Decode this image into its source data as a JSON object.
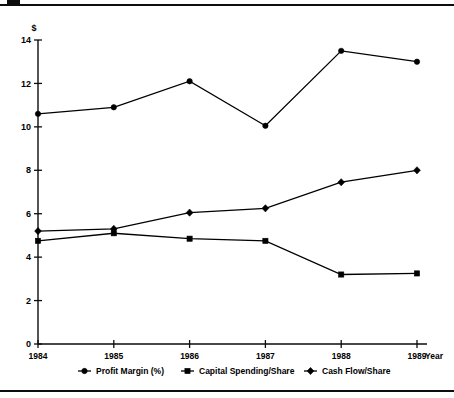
{
  "chart_data": {
    "type": "line",
    "title": "",
    "subtitle": "",
    "xlabel": "Year",
    "ylabel": "$",
    "x": [
      1984,
      1985,
      1986,
      1987,
      1988,
      1989
    ],
    "categories": [
      "1984",
      "1985",
      "1986",
      "1987",
      "1988",
      "1989"
    ],
    "xlim": [
      1984,
      1989
    ],
    "ylim": [
      0,
      14
    ],
    "yticks": [
      0,
      2,
      4,
      6,
      8,
      10,
      12,
      14
    ],
    "ytick_labels": [
      "0",
      "2",
      "4",
      "6",
      "8",
      "10",
      "12",
      "14"
    ],
    "xtick_labels": [
      "1984",
      "1985",
      "1986",
      "1987",
      "1988",
      "1989"
    ],
    "grid": false,
    "legend_position": "bottom",
    "series": [
      {
        "name": "Profit Margin (%)",
        "marker": "circle",
        "color": "#000000",
        "values": [
          10.6,
          10.9,
          12.1,
          10.05,
          13.5,
          13.0
        ]
      },
      {
        "name": "Capital Spending/Share",
        "marker": "square",
        "color": "#000000",
        "values": [
          4.75,
          5.1,
          4.85,
          4.75,
          3.2,
          3.25
        ]
      },
      {
        "name": "Cash Flow/Share",
        "marker": "diamond",
        "color": "#000000",
        "values": [
          5.2,
          5.3,
          6.05,
          6.25,
          7.45,
          8.0
        ]
      }
    ]
  },
  "axes": {
    "y_unit_label": "$",
    "x_axis_name": "Year"
  },
  "legend": {
    "entries": [
      {
        "label": "Profit Margin (%)",
        "marker": "circle"
      },
      {
        "label": "Capital Spending/Share",
        "marker": "square"
      },
      {
        "label": "Cash Flow/Share",
        "marker": "diamond"
      }
    ]
  },
  "colors": {
    "ink": "#000000",
    "rule": "#0d0d0d",
    "background": "#ffffff"
  }
}
